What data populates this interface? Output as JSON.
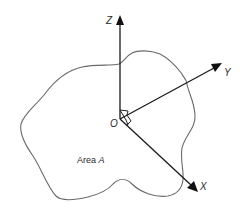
{
  "figure": {
    "region_label": {
      "prefix": "Area ",
      "symbol": "A"
    },
    "origin_label": "O",
    "axes": [
      {
        "name": "Z",
        "direction": "up"
      },
      {
        "name": "Y",
        "direction": "up-right"
      },
      {
        "name": "X",
        "direction": "down-right"
      }
    ],
    "right_angle_markers": 2,
    "colors": {
      "axis": "#1a1a1a",
      "outline": "#6a6a6a",
      "text": "#2a2a2a",
      "background": "#ffffff"
    }
  }
}
